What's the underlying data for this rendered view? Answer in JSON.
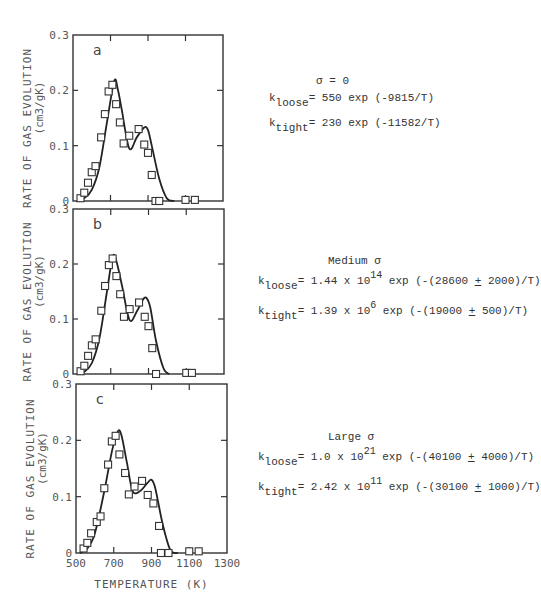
{
  "chart_data": [
    {
      "type": "line",
      "panel": "a",
      "title": "σ = 0",
      "xlabel": "TEMPERATURE (K)",
      "ylabel": "RATE OF GAS EVOLUTION (cm3/gK)",
      "xlim": [
        500,
        1300
      ],
      "ylim": [
        0,
        0.3
      ],
      "yticks": [
        "0",
        "0.1",
        "0.2",
        "0.3"
      ],
      "series": [
        {
          "name": "experimental",
          "style": "open-square",
          "x": [
            540,
            560,
            580,
            600,
            620,
            650,
            670,
            690,
            710,
            730,
            750,
            770,
            800,
            850,
            880,
            900,
            920,
            940,
            960,
            1100,
            1150
          ],
          "y": [
            0.005,
            0.015,
            0.033,
            0.052,
            0.063,
            0.115,
            0.157,
            0.198,
            0.21,
            0.175,
            0.142,
            0.104,
            0.118,
            0.13,
            0.102,
            0.087,
            0.047,
            0.0,
            0.0,
            0.002,
            0.002
          ]
        },
        {
          "name": "model",
          "style": "solid",
          "x": [
            520,
            560,
            600,
            640,
            680,
            720,
            740,
            760,
            800,
            840,
            880,
            900,
            920,
            960,
            1000,
            1040
          ],
          "y": [
            0,
            0.005,
            0.02,
            0.06,
            0.14,
            0.217,
            0.2,
            0.165,
            0.095,
            0.115,
            0.133,
            0.128,
            0.1,
            0.04,
            0.005,
            0
          ]
        }
      ],
      "equations": {
        "k_loose": "550 exp (-9815/T)",
        "k_tight": "230 exp (-11582/T)"
      }
    },
    {
      "type": "line",
      "panel": "b",
      "title": "Medium σ",
      "xlabel": "",
      "ylabel": "RATE OF GAS EVOLUTION (cm3/gK)",
      "xlim": [
        500,
        1300
      ],
      "ylim": [
        0,
        0.3
      ],
      "yticks": [
        "0",
        "0.1",
        "0.2",
        "0.3"
      ],
      "series": [
        {
          "name": "experimental",
          "style": "open-square",
          "x": [
            540,
            560,
            580,
            600,
            620,
            650,
            670,
            690,
            710,
            730,
            750,
            770,
            800,
            850,
            880,
            900,
            920,
            940,
            1100,
            1130
          ],
          "y": [
            0.005,
            0.015,
            0.033,
            0.052,
            0.063,
            0.115,
            0.16,
            0.198,
            0.21,
            0.178,
            0.145,
            0.104,
            0.118,
            0.13,
            0.104,
            0.087,
            0.047,
            0.0,
            0.002,
            0.002
          ]
        },
        {
          "name": "model",
          "style": "solid",
          "x": [
            520,
            560,
            600,
            640,
            680,
            710,
            730,
            760,
            800,
            840,
            870,
            890,
            910,
            940,
            980,
            1010
          ],
          "y": [
            0,
            0.004,
            0.02,
            0.065,
            0.15,
            0.213,
            0.205,
            0.16,
            0.098,
            0.115,
            0.135,
            0.138,
            0.12,
            0.06,
            0.01,
            0
          ]
        }
      ],
      "equations": {
        "k_loose": "1.44 x 10^14 exp (-(28600 ± 2000)/T)",
        "k_tight": "1.39 x 10^6 exp (-(19000 ± 500)/T)"
      }
    },
    {
      "type": "line",
      "panel": "c",
      "title": "Large σ",
      "xlabel": "TEMPERATURE (K)",
      "ylabel": "RATE OF GAS EVOLUTION (cm3/gK)",
      "xlim": [
        500,
        1300
      ],
      "ylim": [
        0,
        0.3
      ],
      "xticks": [
        "500",
        "700",
        "900",
        "1100",
        "1300"
      ],
      "yticks": [
        "0",
        "0.1",
        "0.2",
        "0.3"
      ],
      "series": [
        {
          "name": "experimental",
          "style": "open-square",
          "x": [
            540,
            560,
            580,
            610,
            630,
            650,
            670,
            690,
            710,
            730,
            760,
            780,
            810,
            850,
            880,
            910,
            940,
            950,
            990,
            1100,
            1150
          ],
          "y": [
            0.008,
            0.018,
            0.035,
            0.055,
            0.065,
            0.115,
            0.157,
            0.198,
            0.208,
            0.175,
            0.142,
            0.104,
            0.118,
            0.128,
            0.103,
            0.088,
            0.048,
            0.0,
            0.0,
            0.003,
            0.003
          ]
        },
        {
          "name": "model",
          "style": "solid",
          "x": [
            520,
            560,
            600,
            650,
            690,
            720,
            740,
            770,
            800,
            840,
            880,
            900,
            920,
            960,
            1000,
            1040
          ],
          "y": [
            0,
            0.008,
            0.035,
            0.11,
            0.18,
            0.215,
            0.21,
            0.16,
            0.11,
            0.11,
            0.125,
            0.13,
            0.115,
            0.05,
            0.005,
            0
          ]
        }
      ],
      "equations": {
        "k_loose": "1.0 x 10^21 exp (-(40100 ± 4000)/T)",
        "k_tight": "2.42 x 10^11 exp (-(30100 ± 1000)/T)"
      }
    }
  ],
  "labels": {
    "panel_a": "a",
    "panel_b": "b",
    "panel_c": "c",
    "ylabel_line1": "RATE OF GAS EVOLUTION",
    "ylabel_line2": "(cm3/gK)",
    "xlabel": "TEMPERATURE (K)",
    "xticks": [
      "500",
      "700",
      "900",
      "1100",
      "1300"
    ],
    "yticks": [
      "0",
      "0.1",
      "0.2",
      "0.3"
    ]
  },
  "equations": {
    "a": {
      "title": "σ = 0",
      "loose_sub": "loose",
      "tight_sub": "tight",
      "loose_rhs": "= 550 exp (-9815/T)",
      "tight_rhs": "= 230 exp (-11582/T)"
    },
    "b": {
      "title": "Medium σ",
      "loose_sub": "loose",
      "tight_sub": "tight",
      "loose_pre": "= 1.44 x 10",
      "loose_exp": "14",
      "loose_mid": " exp (-(28600 ",
      "loose_pm": "+",
      "loose_post": " 2000)/T)",
      "tight_pre": "= 1.39 x 10",
      "tight_exp": "6",
      "tight_mid": " exp (-(19000 ",
      "tight_pm": "+",
      "tight_post": " 500)/T)"
    },
    "c": {
      "title": "Large σ",
      "loose_sub": "loose",
      "tight_sub": "tight",
      "loose_pre": "= 1.0 x 10",
      "loose_exp": "21",
      "loose_mid": " exp (-(40100 ",
      "loose_pm": "+",
      "loose_post": " 4000)/T)",
      "tight_pre": "= 2.42 x 10",
      "tight_exp": "11",
      "tight_mid": " exp (-(30100 ",
      "tight_pm": "+",
      "tight_post": " 1000)/T)"
    }
  },
  "k_symbol": "k"
}
